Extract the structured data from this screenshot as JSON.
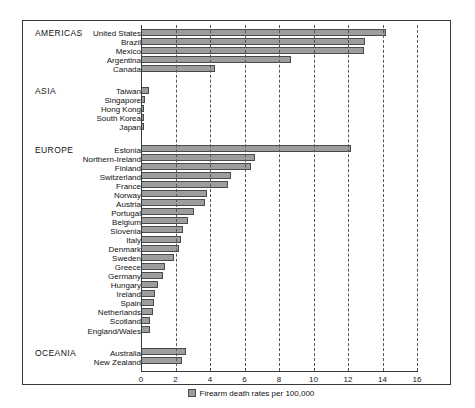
{
  "chart_data": {
    "type": "bar",
    "orientation": "horizontal",
    "title": "",
    "xlabel": "Firearm death rates per 100,000",
    "ylabel": "",
    "xlim": [
      0,
      16
    ],
    "xticks": [
      0,
      2,
      4,
      6,
      8,
      10,
      12,
      14,
      16
    ],
    "grid": true,
    "grid_style": "vertical dashed",
    "legend": {
      "position": "bottom-center",
      "entries": [
        {
          "label": "Firearm death rates per 100,000",
          "color": "#9d9d9d"
        }
      ]
    },
    "groups": [
      {
        "name": "AMERICAS",
        "categories": [
          "United States",
          "Brazil",
          "Mexico",
          "Argentina",
          "Canada"
        ],
        "values": [
          14.2,
          13.0,
          12.9,
          8.7,
          4.3
        ]
      },
      {
        "name": "ASIA",
        "categories": [
          "Taiwan",
          "Singapore",
          "Hong Kong",
          "South Korea",
          "Japan"
        ],
        "values": [
          0.45,
          0.25,
          0.15,
          0.13,
          0.1
        ]
      },
      {
        "name": "EUROPE",
        "categories": [
          "Estonia",
          "Northern-Ireland",
          "Finland",
          "Switzerland",
          "France",
          "Norway",
          "Austria",
          "Portugal",
          "Belgium",
          "Slovenia",
          "Italy",
          "Denmark",
          "Sweden",
          "Greece",
          "Germany",
          "Hungary",
          "Ireland",
          "Spain",
          "Netherlands",
          "Scotland",
          "England/Wales"
        ],
        "values": [
          12.2,
          6.6,
          6.35,
          5.2,
          5.05,
          3.8,
          3.7,
          3.1,
          2.7,
          2.45,
          2.3,
          2.2,
          1.9,
          1.4,
          1.25,
          1.0,
          0.8,
          0.75,
          0.7,
          0.55,
          0.5
        ]
      },
      {
        "name": "OCEANIA",
        "categories": [
          "Australia",
          "New Zealand"
        ],
        "values": [
          2.6,
          2.35
        ]
      }
    ],
    "categories": [
      "United States",
      "Brazil",
      "Mexico",
      "Argentina",
      "Canada",
      "Taiwan",
      "Singapore",
      "Hong Kong",
      "South Korea",
      "Japan",
      "Estonia",
      "Northern-Ireland",
      "Finland",
      "Switzerland",
      "France",
      "Norway",
      "Austria",
      "Portugal",
      "Belgium",
      "Slovenia",
      "Italy",
      "Denmark",
      "Sweden",
      "Greece",
      "Germany",
      "Hungary",
      "Ireland",
      "Spain",
      "Netherlands",
      "Scotland",
      "England/Wales",
      "Australia",
      "New Zealand"
    ],
    "values": [
      14.2,
      13.0,
      12.9,
      8.7,
      4.3,
      0.45,
      0.25,
      0.15,
      0.13,
      0.1,
      12.2,
      6.6,
      6.35,
      5.2,
      5.05,
      3.8,
      3.7,
      3.1,
      2.7,
      2.45,
      2.3,
      2.2,
      1.9,
      1.4,
      1.25,
      1.0,
      0.8,
      0.75,
      0.7,
      0.55,
      0.5,
      2.6,
      2.35
    ],
    "colors": {
      "bar_fill": "#9d9d9d",
      "bar_stroke": "#4b4b4b",
      "axis": "#3a3a3a",
      "grid": "#555555",
      "text": "#111111",
      "background": "#ffffff"
    }
  }
}
